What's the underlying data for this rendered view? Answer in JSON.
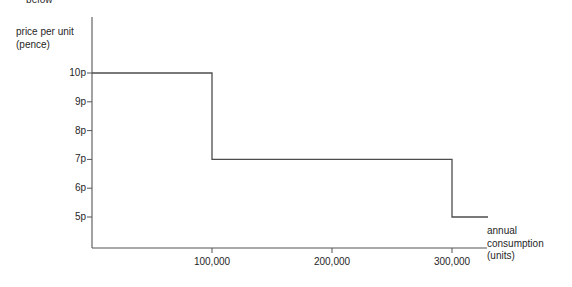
{
  "page": {
    "cut_off_text": "below"
  },
  "chart_data": {
    "type": "line",
    "subtype": "step",
    "title": "",
    "xlabel": "annual consumption (units)",
    "ylabel": "price per unit (pence)",
    "x": [
      0,
      100000,
      100000,
      300000,
      300000,
      330000
    ],
    "y": [
      10,
      10,
      7,
      7,
      5,
      5
    ],
    "steps": [
      {
        "from": 0,
        "to": 100000,
        "price": 10,
        "price_label": "10p"
      },
      {
        "from": 100000,
        "to": 300000,
        "price": 7,
        "price_label": "7p"
      },
      {
        "from": 300000,
        "to": 330000,
        "price": 5,
        "price_label": "5p"
      }
    ],
    "xticks": [
      100000,
      200000,
      300000
    ],
    "xticklabels": [
      "100,000",
      "200,000",
      "300,000"
    ],
    "yticks": [
      5,
      6,
      7,
      8,
      9,
      10
    ],
    "yticklabels": [
      "5p",
      "6p",
      "7p",
      "8p",
      "9p",
      "10p"
    ],
    "xlim": [
      0,
      330000
    ],
    "ylim": [
      4,
      10.9
    ],
    "grid": false,
    "legend": false,
    "line_color": "#4d4d4d",
    "axis_color": "#555555"
  }
}
